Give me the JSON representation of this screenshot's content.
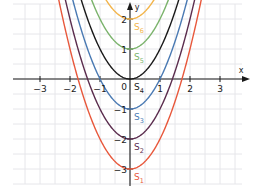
{
  "diagram": {
    "type": "function-plot",
    "axes": {
      "x_label": "x",
      "y_label": "y",
      "x_ticks": [
        {
          "value": -3,
          "label": "−3"
        },
        {
          "value": -2,
          "label": "−2"
        },
        {
          "value": -1,
          "label": "−1"
        },
        {
          "value": 1,
          "label": "1"
        },
        {
          "value": 2,
          "label": "2"
        },
        {
          "value": 3,
          "label": "3"
        }
      ],
      "y_ticks": [
        {
          "value": 2,
          "label": "2"
        },
        {
          "value": 1,
          "label": "1"
        },
        {
          "value": -1,
          "label": "−1"
        },
        {
          "value": -2,
          "label": "−2"
        },
        {
          "value": -3,
          "label": "−3"
        }
      ],
      "origin_label": "0",
      "x_range": [
        -3.9,
        4
      ],
      "y_range": [
        -3.5,
        2.5
      ],
      "grid": true,
      "grid_step": 0.5
    },
    "curves": [
      {
        "name": "S1",
        "label": "S",
        "sub": "1",
        "c": -3,
        "color": "#e8583c"
      },
      {
        "name": "S2",
        "label": "S",
        "sub": "2",
        "c": -2,
        "color": "#5b2d4e"
      },
      {
        "name": "S3",
        "label": "S",
        "sub": "3",
        "c": -1,
        "color": "#4a7ab3"
      },
      {
        "name": "S4",
        "label": "S",
        "sub": "4",
        "c": 0,
        "color": "#1a1a1a"
      },
      {
        "name": "S5",
        "label": "S",
        "sub": "5",
        "c": 1,
        "color": "#7bb36c"
      },
      {
        "name": "S6",
        "label": "S",
        "sub": "6",
        "c": 2,
        "color": "#f2b44a"
      }
    ]
  }
}
